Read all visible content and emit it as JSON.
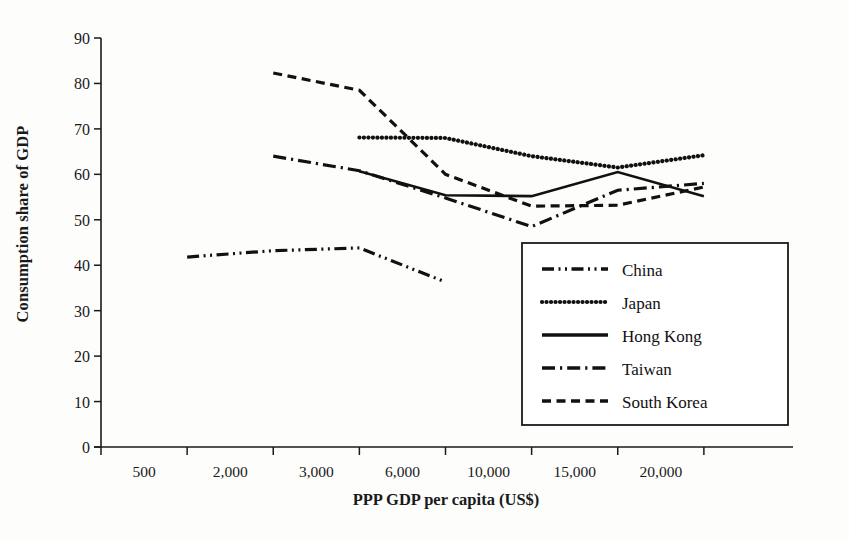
{
  "chart_data": {
    "type": "line",
    "title": "",
    "xlabel": "PPP GDP per capita (US$)",
    "ylabel": "Consumption share of GDP",
    "categories": [
      "500",
      "2,000",
      "3,000",
      "6,000",
      "10,000",
      "15,000",
      "20,000"
    ],
    "xtick_labels": [
      "500",
      "2,000",
      "3,000",
      "6,000",
      "10,000",
      "15,000",
      "20,000"
    ],
    "ytick_labels": [
      "0",
      "10",
      "20",
      "30",
      "40",
      "50",
      "60",
      "70",
      "80",
      "90"
    ],
    "ylim": [
      0,
      90
    ],
    "ytick_step": 10,
    "grid": false,
    "legend_position": "inside-lower-right",
    "axis_color": "#1a1a1a",
    "series": [
      {
        "name": "China",
        "style": "dashdotdot",
        "color": "#111111",
        "x": [
          "500",
          "2,000",
          "3,000",
          "6,000"
        ],
        "values": [
          41.8,
          43.2,
          43.8,
          36.3
        ]
      },
      {
        "name": "Japan",
        "style": "dotted",
        "color": "#111111",
        "x": [
          "3,000",
          "6,000",
          "10,000",
          "15,000",
          "20,000"
        ],
        "values": [
          68.1,
          68.0,
          64.0,
          61.5,
          64.2
        ]
      },
      {
        "name": "Hong Kong",
        "style": "solid",
        "color": "#111111",
        "x": [
          "3,000",
          "6,000",
          "10,000",
          "15,000",
          "20,000"
        ],
        "values": [
          60.7,
          55.4,
          55.2,
          60.5,
          55.2
        ]
      },
      {
        "name": "Taiwan",
        "style": "dashdot",
        "color": "#111111",
        "x": [
          "2,000",
          "3,000",
          "6,000",
          "10,000",
          "15,000",
          "20,000"
        ],
        "values": [
          64.0,
          60.8,
          54.8,
          48.5,
          56.5,
          58.0
        ]
      },
      {
        "name": "South Korea",
        "style": "dashed",
        "color": "#111111",
        "x": [
          "2,000",
          "3,000",
          "6,000",
          "10,000",
          "15,000",
          "20,000"
        ],
        "values": [
          82.3,
          78.5,
          60.0,
          53.0,
          53.2,
          57.2
        ]
      }
    ]
  },
  "legend": {
    "items": [
      {
        "label": "China"
      },
      {
        "label": "Japan"
      },
      {
        "label": "Hong Kong"
      },
      {
        "label": "Taiwan"
      },
      {
        "label": "South Korea"
      }
    ]
  }
}
